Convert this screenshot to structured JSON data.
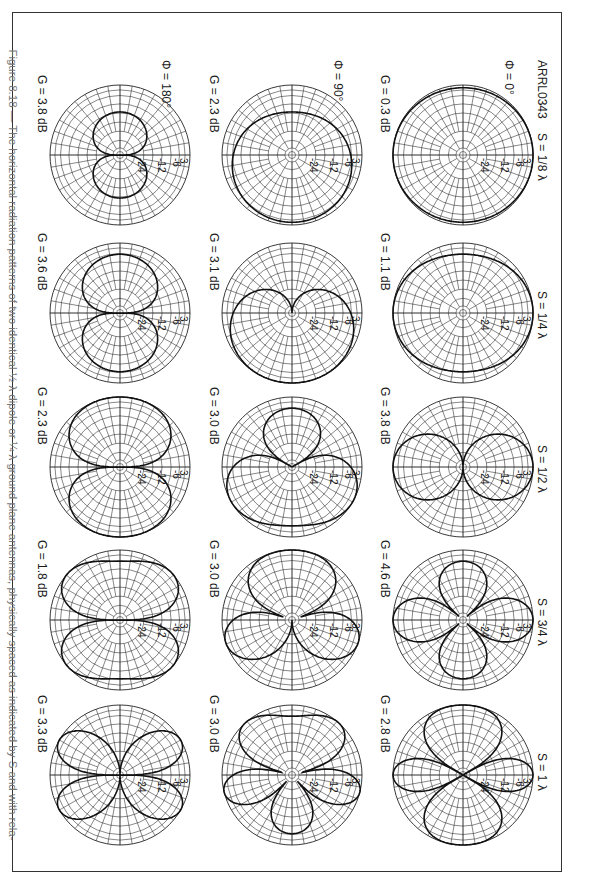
{
  "figure": {
    "id_label": "ARRL0343",
    "caption": "Figure 8.18 — The horizontal radiation patterns of two identical ½ λ dipole or ¼ λ ground plane antennas, physically spaced as indicated by S and with rela-",
    "orientation": "rotated 90° clockwise (landscape figure on portrait page)"
  },
  "chart_data": {
    "type": "polar_grid",
    "column_labels": [
      "S = 1/8 λ",
      "S = 1/4 λ",
      "S = 1/2 λ",
      "S = 3/4 λ",
      "S = 1 λ"
    ],
    "row_labels": [
      "Φ = 0°",
      "Φ = 90°",
      "Φ = 180°"
    ],
    "spacings_wavelengths": [
      0.125,
      0.25,
      0.5,
      0.75,
      1.0
    ],
    "phases_deg": [
      0,
      90,
      180
    ],
    "radial_ticks_db": [
      "3",
      "6",
      "12",
      "24"
    ],
    "radial_tick_values_db": [
      -3,
      -6,
      -12,
      -24
    ],
    "grid": true,
    "gain_db": [
      [
        0.3,
        1.1,
        3.8,
        4.6,
        2.8
      ],
      [
        2.3,
        3.1,
        3.0,
        3.0,
        3.0
      ],
      [
        3.8,
        3.6,
        2.3,
        1.8,
        3.3
      ]
    ],
    "gain_labels": [
      [
        "G = 0.3 dB",
        "G = 1.1 dB",
        "G = 3.8 dB",
        "G = 4.6 dB",
        "G = 2.8 dB"
      ],
      [
        "G = 2.3 dB",
        "G = 3.1 dB",
        "G = 3.0 dB",
        "G = 3.0 dB",
        "G = 3.0 dB"
      ],
      [
        "G = 3.8 dB",
        "G = 3.6 dB",
        "G = 2.3 dB",
        "G = 1.8 dB",
        "G = 3.3 dB"
      ]
    ],
    "pattern_shapes": [
      [
        "near-circular (omni)",
        "slightly oval",
        "figure-8 broadside",
        "four-lobe cloverleaf",
        "four main lobes + small endfire"
      ],
      [
        "slightly offset circle",
        "cardioid",
        "three-lobe (one large, one smaller)",
        "three-lobe",
        "multi-lobe asymmetric"
      ],
      [
        "figure-8 endfire",
        "figure-8 endfire",
        "figure-8 endfire",
        "figure-8 flattened endfire",
        "four-lobe X"
      ]
    ]
  }
}
